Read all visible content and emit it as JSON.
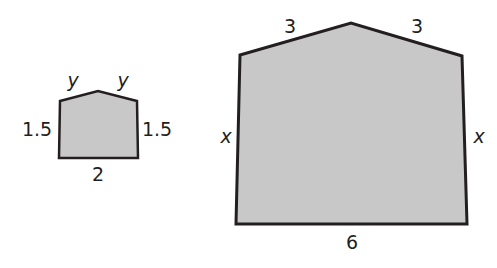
{
  "figure": {
    "fill_color": "#c8c8c8",
    "stroke_color": "#231f20",
    "small_shape": {
      "points": [
        [
          60,
          101
        ],
        [
          98,
          91
        ],
        [
          137,
          101
        ],
        [
          138,
          158
        ],
        [
          59,
          158
        ]
      ],
      "labels": {
        "top_left": "y",
        "top_right": "y",
        "left": "1.5",
        "right": "1.5",
        "bottom": "2"
      }
    },
    "large_shape": {
      "points": [
        [
          240,
          55
        ],
        [
          351,
          23
        ],
        [
          462,
          56
        ],
        [
          467,
          224
        ],
        [
          236,
          224
        ]
      ],
      "labels": {
        "top_left": "3",
        "top_right": "3",
        "left": "x",
        "right": "x",
        "bottom": "6"
      }
    }
  }
}
